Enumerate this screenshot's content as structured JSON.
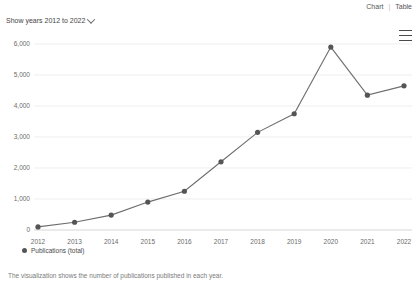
{
  "header": {
    "view_chart_label": "Chart",
    "view_separator": "|",
    "view_table_label": "Table",
    "year_selector_label": "Show years 2012 to 2022",
    "menu_icon": "hamburger-menu-icon"
  },
  "legend": {
    "series_label": "Publications (total)"
  },
  "caption": {
    "text": "The visualization shows the number of publications published in each year."
  },
  "colors": {
    "line": "#6e6e6e",
    "dot": "#555555",
    "grid": "#e6e6e6",
    "axis_text": "#6b6b6b"
  },
  "chart_data": {
    "type": "line",
    "title": "",
    "xlabel": "",
    "ylabel": "",
    "categories": [
      "2012",
      "2013",
      "2014",
      "2015",
      "2016",
      "2017",
      "2018",
      "2019",
      "2020",
      "2021",
      "2022"
    ],
    "series": [
      {
        "name": "Publications (total)",
        "values": [
          100,
          250,
          480,
          900,
          1250,
          2200,
          3150,
          3750,
          5900,
          4350,
          4650
        ]
      }
    ],
    "ylim": [
      0,
      6000
    ],
    "yticks": [
      0,
      1000,
      2000,
      3000,
      4000,
      5000,
      6000
    ],
    "ytick_labels": [
      "0",
      "1,000",
      "2,000",
      "3,000",
      "4,000",
      "5,000",
      "6,000"
    ],
    "grid": true,
    "legend_position": "bottom-left"
  }
}
